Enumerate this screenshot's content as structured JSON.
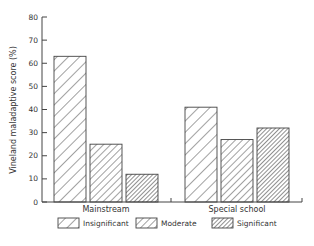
{
  "chart_data": {
    "type": "bar",
    "title": "",
    "xlabel": "",
    "ylabel": "Vineland maladaptive score (%)",
    "ylim": [
      0,
      80
    ],
    "yticks": [
      0,
      10,
      20,
      30,
      40,
      50,
      60,
      70,
      80
    ],
    "categories": [
      "Mainstream",
      "Special school"
    ],
    "series": [
      {
        "name": "Insignificant",
        "values": [
          63,
          41
        ],
        "pattern": "sparse-hatch"
      },
      {
        "name": "Moderate",
        "values": [
          25,
          27
        ],
        "pattern": "medium-hatch"
      },
      {
        "name": "Significant",
        "values": [
          12,
          32
        ],
        "pattern": "dense-hatch"
      }
    ],
    "grid": false,
    "legend_position": "bottom"
  },
  "colors": {
    "stroke": "#444444",
    "text": "#333333",
    "background": "#ffffff"
  }
}
